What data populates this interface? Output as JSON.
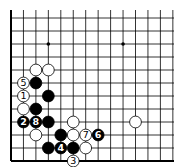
{
  "diagram": {
    "type": "go-board",
    "grid": {
      "x0": 11,
      "y0": 18,
      "spacing_x": 12.45,
      "spacing_y": 13.0,
      "cols": 14,
      "rows": 12,
      "top_y": 10,
      "right_x": 174,
      "left_edge": true,
      "bottom_edge": true
    },
    "star_points": [
      {
        "col": 3,
        "row": 2
      },
      {
        "col": 9,
        "row": 2
      }
    ],
    "stones": [
      {
        "color": "white",
        "col": 2,
        "row": 4,
        "label": ""
      },
      {
        "color": "white",
        "col": 3,
        "row": 4,
        "label": ""
      },
      {
        "color": "white",
        "col": 1,
        "row": 5,
        "label": "5"
      },
      {
        "color": "black",
        "col": 2,
        "row": 5,
        "label": ""
      },
      {
        "color": "white",
        "col": 1,
        "row": 6,
        "label": "1"
      },
      {
        "color": "black",
        "col": 3,
        "row": 6,
        "label": ""
      },
      {
        "color": "white",
        "col": 1,
        "row": 7,
        "label": ""
      },
      {
        "color": "black",
        "col": 2,
        "row": 7,
        "label": ""
      },
      {
        "color": "black",
        "col": 1,
        "row": 8,
        "label": "2"
      },
      {
        "color": "black",
        "col": 2,
        "row": 8,
        "label": "8"
      },
      {
        "color": "black",
        "col": 3,
        "row": 8,
        "label": ""
      },
      {
        "color": "white",
        "col": 5,
        "row": 8,
        "label": ""
      },
      {
        "color": "white",
        "col": 10,
        "row": 8,
        "label": ""
      },
      {
        "color": "white",
        "col": 2,
        "row": 9,
        "label": ""
      },
      {
        "color": "black",
        "col": 4,
        "row": 9,
        "label": ""
      },
      {
        "color": "white",
        "col": 5,
        "row": 9,
        "label": ""
      },
      {
        "color": "white",
        "col": 6,
        "row": 9,
        "label": "7"
      },
      {
        "color": "black",
        "col": 7,
        "row": 9,
        "label": "6"
      },
      {
        "color": "black",
        "col": 3,
        "row": 10,
        "label": ""
      },
      {
        "color": "black",
        "col": 4,
        "row": 10,
        "label": "4"
      },
      {
        "color": "black",
        "col": 5,
        "row": 10,
        "label": ""
      },
      {
        "color": "white",
        "col": 6,
        "row": 10,
        "label": ""
      },
      {
        "color": "white",
        "col": 5,
        "row": 11,
        "label": "3"
      }
    ]
  }
}
